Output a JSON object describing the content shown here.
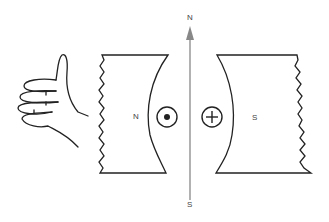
{
  "diagram": {
    "labels": {
      "field_top": "N",
      "field_bottom": "S",
      "pole_left": "N",
      "pole_right": "S"
    },
    "symbols": {
      "left_conductor": "current-out-of-page (dot)",
      "right_conductor": "current-into-page (cross)"
    },
    "colors": {
      "line": "#222222",
      "arrow": "#888888"
    }
  }
}
